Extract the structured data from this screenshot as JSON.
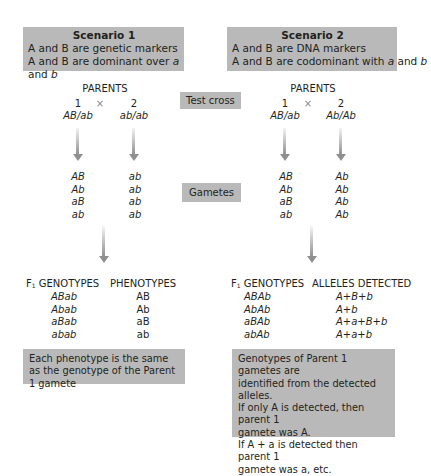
{
  "scenario1": {
    "title": "Scenario 1",
    "line1": "A and B are genetic markers",
    "line2_pre": "A and B are dominant over ",
    "line2_a": "a",
    "line2_mid": " and ",
    "line2_b": "b"
  },
  "scenario2": {
    "title": "Scenario 2",
    "line1": "A and B are DNA markers",
    "line2_pre": "A and B are codominant with ",
    "line2_a": "a",
    "line2_mid": " and ",
    "line2_b": "b"
  },
  "center_labels": {
    "test_cross": "Test cross",
    "gametes": "Gametes"
  },
  "left": {
    "parents_label": "PARENTS",
    "parent1_num": "1",
    "parent2_num": "2",
    "cross_symbol": "×",
    "parent1_genotype": "AB/ab",
    "parent2_genotype": "ab/ab",
    "gametes_parent1": [
      "AB",
      "Ab",
      "aB",
      "ab"
    ],
    "gametes_parent2": [
      "ab",
      "ab",
      "ab",
      "ab"
    ],
    "f1_header_pre": "F",
    "f1_header_sub": "1",
    "f1_header_post": " GENOTYPES",
    "second_header": "PHENOTYPES",
    "f1_genotypes": [
      "ABab",
      "Abab",
      "aBab",
      "abab"
    ],
    "phenotypes": [
      "AB",
      "Ab",
      "aB",
      "ab"
    ],
    "note": "Each phenotype is the same as the genotype of the Parent 1 gamete"
  },
  "right": {
    "parents_label": "PARENTS",
    "parent1_num": "1",
    "parent2_num": "2",
    "cross_symbol": "×",
    "parent1_genotype": "AB/ab",
    "parent2_genotype": "Ab/Ab",
    "gametes_parent1": [
      "AB",
      "Ab",
      "aB",
      "ab"
    ],
    "gametes_parent2": [
      "Ab",
      "Ab",
      "Ab",
      "Ab"
    ],
    "f1_header_pre": "F",
    "f1_header_sub": "1",
    "f1_header_post": " GENOTYPES",
    "second_header": "ALLELES DETECTED",
    "f1_genotypes": [
      "ABAb",
      "AbAb",
      "aBAb",
      "abAb"
    ],
    "alleles_detected": [
      "A+B+b",
      "A+b",
      "A+a+B+b",
      "A+a+b"
    ],
    "note_lines": [
      "Genotypes of Parent 1 gametes are",
      "identified from the detected alleles.",
      "If only A is detected, then parent 1",
      "gamete was A.",
      "If A + a is detected then parent 1",
      "gamete was a, etc."
    ]
  },
  "colors": {
    "box_gray": "#b9b9b9",
    "arrow_gray": "#8f8f8f",
    "text": "#231f20"
  }
}
